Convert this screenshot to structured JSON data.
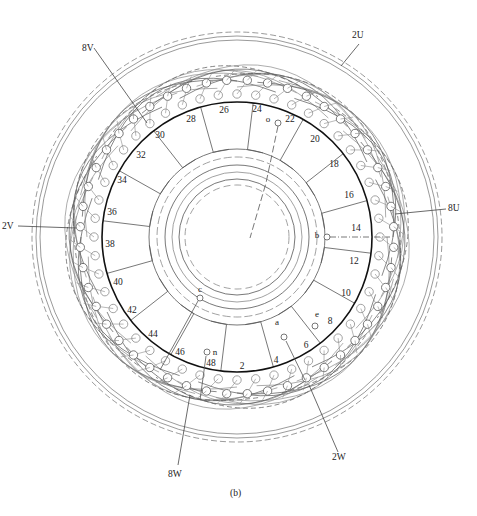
{
  "figure": {
    "caption": "(b)",
    "center": [
      237,
      237
    ],
    "thick_ring_radius": 135,
    "outer_radius": 205,
    "hub_radius": 58,
    "line_color": "#555555",
    "light_line_color": "#8a8a8a",
    "thick_color": "#111111"
  },
  "slot_labels": [
    {
      "text": "2",
      "x": 242,
      "y": 369
    },
    {
      "text": "4",
      "x": 276,
      "y": 363
    },
    {
      "text": "6",
      "x": 306,
      "y": 348
    },
    {
      "text": "8",
      "x": 330,
      "y": 324
    },
    {
      "text": "10",
      "x": 346,
      "y": 296
    },
    {
      "text": "12",
      "x": 354,
      "y": 264
    },
    {
      "text": "14",
      "x": 356,
      "y": 231
    },
    {
      "text": "16",
      "x": 349,
      "y": 198
    },
    {
      "text": "18",
      "x": 334,
      "y": 167
    },
    {
      "text": "20",
      "x": 315,
      "y": 142
    },
    {
      "text": "22",
      "x": 290,
      "y": 122
    },
    {
      "text": "24",
      "x": 257,
      "y": 112
    },
    {
      "text": "26",
      "x": 224,
      "y": 113
    },
    {
      "text": "28",
      "x": 191,
      "y": 122
    },
    {
      "text": "30",
      "x": 160,
      "y": 138
    },
    {
      "text": "32",
      "x": 141,
      "y": 158
    },
    {
      "text": "34",
      "x": 122,
      "y": 183
    },
    {
      "text": "36",
      "x": 112,
      "y": 215
    },
    {
      "text": "38",
      "x": 110,
      "y": 247
    },
    {
      "text": "40",
      "x": 118,
      "y": 285
    },
    {
      "text": "42",
      "x": 132,
      "y": 313
    },
    {
      "text": "44",
      "x": 153,
      "y": 337
    },
    {
      "text": "46",
      "x": 180,
      "y": 355
    },
    {
      "text": "48",
      "x": 211,
      "y": 366
    }
  ],
  "terminals": [
    {
      "text": "o",
      "x": 268,
      "y": 122,
      "cx": 278,
      "cy": 123
    },
    {
      "text": "b",
      "x": 317,
      "y": 238,
      "cx": 327,
      "cy": 237
    },
    {
      "text": "c",
      "x": 200,
      "y": 292,
      "cx": 200,
      "cy": 298
    },
    {
      "text": "n",
      "x": 215,
      "y": 355,
      "cx": 207,
      "cy": 352
    },
    {
      "text": "a",
      "x": 277,
      "y": 325,
      "cx": 284,
      "cy": 337
    },
    {
      "text": "e",
      "x": 317,
      "y": 317,
      "cx": 315,
      "cy": 326
    }
  ],
  "callouts": [
    {
      "text": "8V",
      "x": 82,
      "y": 51,
      "line": [
        [
          94,
          48
        ],
        [
          147,
          123
        ]
      ]
    },
    {
      "text": "2U",
      "x": 352,
      "y": 38,
      "line": [
        [
          359,
          44
        ],
        [
          341,
          66
        ]
      ]
    },
    {
      "text": "2V",
      "x": 2,
      "y": 229,
      "line": [
        [
          18,
          226
        ],
        [
          76,
          228
        ]
      ]
    },
    {
      "text": "8U",
      "x": 448,
      "y": 211,
      "line": [
        [
          446,
          209
        ],
        [
          395,
          214
        ]
      ]
    },
    {
      "text": "8W",
      "x": 168,
      "y": 477,
      "line": [
        [
          178,
          465
        ],
        [
          190,
          395
        ]
      ]
    },
    {
      "text": "2W",
      "x": 332,
      "y": 460,
      "line": [
        [
          338,
          452
        ],
        [
          309,
          385
        ]
      ]
    }
  ],
  "connector_lines": [
    {
      "name": "b-lead",
      "points": [
        [
          330,
          237
        ],
        [
          390,
          237
        ]
      ],
      "dash": "6 2 1 2"
    },
    {
      "name": "c-lead",
      "points": [
        [
          198,
          301
        ],
        [
          160,
          370
        ]
      ],
      "dash": ""
    },
    {
      "name": "n-lead",
      "points": [
        [
          206,
          356
        ],
        [
          200,
          400
        ]
      ],
      "dash": ""
    },
    {
      "name": "a-lead",
      "points": [
        [
          286,
          341
        ],
        [
          305,
          380
        ]
      ],
      "dash": ""
    },
    {
      "name": "o-lead",
      "points": [
        [
          278,
          126
        ],
        [
          266,
          183
        ],
        [
          250,
          238
        ]
      ],
      "dash": "7 3"
    }
  ]
}
